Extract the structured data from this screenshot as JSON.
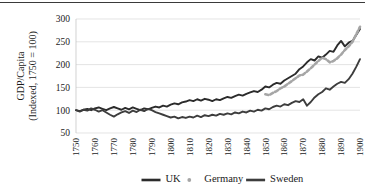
{
  "chart_data": {
    "type": "line",
    "title": "",
    "subtitle": "",
    "xlabel": "",
    "ylabel": "GDP/Capita\n(Indexed, 1750 = 100)",
    "ylabel_line1": "GDP/Capita",
    "ylabel_line2": "(Indexed, 1750 = 100)",
    "xlim": [
      1750,
      1900
    ],
    "ylim": [
      50,
      300
    ],
    "yticks": [
      50,
      100,
      150,
      200,
      250,
      300
    ],
    "ytick_labels": [
      "50",
      "100",
      "150",
      "200",
      "250",
      "300"
    ],
    "xticks": [
      1750,
      1760,
      1770,
      1780,
      1790,
      1800,
      1810,
      1820,
      1830,
      1840,
      1850,
      1860,
      1870,
      1880,
      1890,
      1900
    ],
    "xtick_labels": [
      "1750",
      "1760",
      "1770",
      "1780",
      "1790",
      "1800",
      "1810",
      "1820",
      "1830",
      "1840",
      "1850",
      "1860",
      "1870",
      "1880",
      "1890",
      "1900"
    ],
    "grid": true,
    "grid_axis": "y",
    "legend_position": "bottom",
    "colors": {
      "uk": "#2b2b2b",
      "germany": "#a6a6a6",
      "sweden": "#3d3d3d",
      "gridline": "#d9d9d9",
      "text": "#1a1a1a",
      "background": "#ffffff",
      "top_rule": "#3a3a3a"
    },
    "series": [
      {
        "name": "UK",
        "color_key": "uk",
        "style": "solid",
        "x": [
          1750,
          1752,
          1754,
          1756,
          1758,
          1760,
          1762,
          1764,
          1766,
          1768,
          1770,
          1772,
          1774,
          1776,
          1778,
          1780,
          1782,
          1784,
          1786,
          1788,
          1790,
          1792,
          1794,
          1796,
          1798,
          1800,
          1802,
          1804,
          1806,
          1808,
          1810,
          1812,
          1814,
          1816,
          1818,
          1820,
          1822,
          1824,
          1826,
          1828,
          1830,
          1832,
          1834,
          1836,
          1838,
          1840,
          1842,
          1844,
          1846,
          1848,
          1850,
          1852,
          1854,
          1856,
          1858,
          1860,
          1862,
          1864,
          1866,
          1868,
          1870,
          1872,
          1874,
          1876,
          1878,
          1880,
          1882,
          1884,
          1886,
          1888,
          1890,
          1892,
          1894,
          1896,
          1898,
          1900
        ],
        "values": [
          100,
          98,
          101,
          103,
          100,
          104,
          106,
          103,
          100,
          104,
          107,
          104,
          101,
          105,
          102,
          106,
          103,
          100,
          104,
          102,
          105,
          108,
          106,
          110,
          108,
          112,
          115,
          113,
          117,
          119,
          122,
          120,
          124,
          121,
          125,
          123,
          120,
          124,
          122,
          126,
          129,
          127,
          131,
          134,
          132,
          136,
          139,
          142,
          140,
          145,
          152,
          150,
          156,
          160,
          158,
          165,
          170,
          175,
          180,
          190,
          196,
          205,
          212,
          209,
          218,
          215,
          222,
          230,
          228,
          242,
          252,
          240,
          248,
          252,
          265,
          278
        ]
      },
      {
        "name": "Germany",
        "color_key": "germany",
        "style": "dotted",
        "x": [
          1850,
          1852,
          1854,
          1856,
          1858,
          1860,
          1862,
          1864,
          1866,
          1868,
          1870,
          1872,
          1874,
          1876,
          1878,
          1880,
          1882,
          1884,
          1886,
          1888,
          1890,
          1892,
          1894,
          1896,
          1898,
          1900
        ],
        "values": [
          135,
          133,
          138,
          142,
          148,
          152,
          158,
          164,
          170,
          176,
          178,
          185,
          192,
          200,
          208,
          215,
          212,
          205,
          208,
          214,
          222,
          232,
          240,
          250,
          266,
          283
        ]
      },
      {
        "name": "Sweden",
        "color_key": "sweden",
        "style": "solid",
        "x": [
          1750,
          1752,
          1754,
          1756,
          1758,
          1760,
          1762,
          1764,
          1766,
          1768,
          1770,
          1772,
          1774,
          1776,
          1778,
          1780,
          1782,
          1784,
          1786,
          1788,
          1790,
          1792,
          1794,
          1796,
          1798,
          1800,
          1802,
          1804,
          1806,
          1808,
          1810,
          1812,
          1814,
          1816,
          1818,
          1820,
          1822,
          1824,
          1826,
          1828,
          1830,
          1832,
          1834,
          1836,
          1838,
          1840,
          1842,
          1844,
          1846,
          1848,
          1850,
          1852,
          1854,
          1856,
          1858,
          1860,
          1862,
          1864,
          1866,
          1868,
          1870,
          1872,
          1874,
          1876,
          1878,
          1880,
          1882,
          1884,
          1886,
          1888,
          1890,
          1892,
          1894,
          1896,
          1898,
          1900
        ],
        "values": [
          100,
          97,
          101,
          99,
          104,
          101,
          97,
          100,
          95,
          90,
          86,
          91,
          95,
          98,
          94,
          99,
          96,
          101,
          98,
          103,
          100,
          96,
          93,
          90,
          87,
          84,
          86,
          82,
          85,
          83,
          86,
          84,
          88,
          85,
          89,
          87,
          90,
          88,
          92,
          90,
          93,
          91,
          95,
          93,
          97,
          95,
          99,
          97,
          101,
          99,
          104,
          102,
          107,
          110,
          108,
          113,
          111,
          116,
          120,
          118,
          124,
          110,
          118,
          128,
          135,
          140,
          148,
          145,
          152,
          158,
          162,
          160,
          168,
          180,
          195,
          212
        ]
      }
    ],
    "legend": [
      {
        "label": "UK",
        "marker": "line",
        "color_key": "uk"
      },
      {
        "label": "Germany",
        "marker": "dot",
        "color_key": "germany"
      },
      {
        "label": "Sweden",
        "marker": "line",
        "color_key": "sweden"
      }
    ]
  }
}
